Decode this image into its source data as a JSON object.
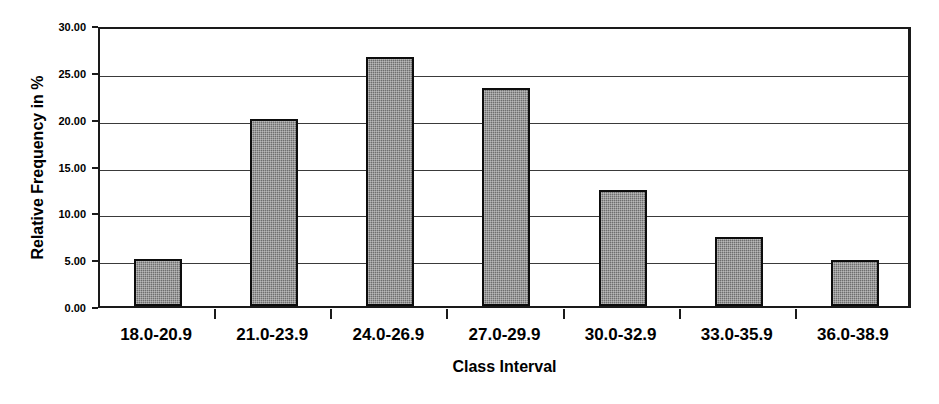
{
  "chart_data": {
    "type": "bar",
    "title": "",
    "xlabel": "Class Interval",
    "ylabel": "Relative Frequency in %",
    "categories": [
      "18.0-20.9",
      "21.0-23.9",
      "24.0-26.9",
      "27.0-29.9",
      "30.0-32.9",
      "33.0-35.9",
      "36.0-38.9"
    ],
    "values": [
      5.0,
      20.0,
      26.6,
      23.3,
      12.4,
      7.4,
      4.9
    ],
    "ylim": [
      0.0,
      30.0
    ],
    "ytick_labels": [
      "30.00",
      "25.00",
      "20.00",
      "15.00",
      "10.00",
      "5.00",
      "0.00"
    ],
    "ytick_values": [
      30.0,
      25.0,
      20.0,
      15.0,
      10.0,
      5.0,
      0.0
    ],
    "grid": true,
    "legend": false,
    "bar_color": "#6e6e6e",
    "bar_border_color": "#0d0d0d",
    "axis_color": "#1a1a1a",
    "grid_color": "#3a3a3a",
    "background_color": "#ffffff"
  }
}
